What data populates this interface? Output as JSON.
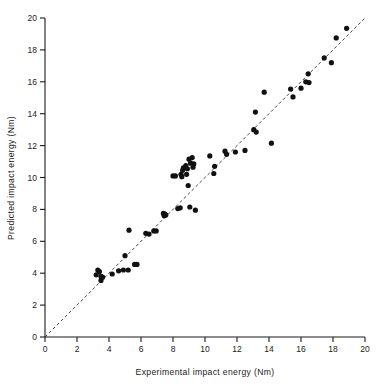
{
  "chart_data": {
    "type": "scatter",
    "title": "",
    "xlabel": "Experimental impact energy  (Nm)",
    "ylabel": "Predicted impact energy  (Nm)",
    "xlim": [
      0,
      20
    ],
    "ylim": [
      0,
      20
    ],
    "xticks": [
      0,
      2,
      4,
      6,
      8,
      10,
      12,
      14,
      16,
      18,
      20
    ],
    "yticks": [
      0,
      2,
      4,
      6,
      8,
      10,
      12,
      14,
      16,
      18,
      20
    ],
    "xtick_labels": [
      "0",
      "2",
      "4",
      "6",
      "8",
      "10",
      "12",
      "14",
      "16",
      "18",
      "20"
    ],
    "ytick_labels": [
      "0",
      "2",
      "4",
      "6",
      "8",
      "10",
      "12",
      "14",
      "16",
      "18",
      "20"
    ],
    "grid": false,
    "legend": null,
    "marker": "filled-circle",
    "marker_color": "#111111",
    "reference_line": {
      "name": "y = x parity line",
      "style": "dashed",
      "color": "#2b2b2b",
      "from": [
        0,
        0
      ],
      "to": [
        20,
        20
      ]
    },
    "points": [
      [
        3.2,
        3.9
      ],
      [
        3.3,
        4.2
      ],
      [
        3.4,
        4.1
      ],
      [
        3.5,
        3.8
      ],
      [
        3.5,
        3.55
      ],
      [
        3.6,
        3.75
      ],
      [
        4.2,
        3.95
      ],
      [
        4.6,
        4.15
      ],
      [
        4.9,
        4.2
      ],
      [
        5.0,
        5.1
      ],
      [
        5.2,
        4.2
      ],
      [
        5.25,
        6.7
      ],
      [
        5.6,
        4.55
      ],
      [
        5.75,
        4.55
      ],
      [
        6.3,
        6.5
      ],
      [
        6.5,
        6.45
      ],
      [
        6.8,
        6.65
      ],
      [
        6.95,
        6.65
      ],
      [
        7.4,
        7.75
      ],
      [
        7.45,
        7.6
      ],
      [
        7.5,
        7.7
      ],
      [
        7.55,
        7.65
      ],
      [
        8.0,
        10.1
      ],
      [
        8.15,
        10.1
      ],
      [
        8.3,
        8.05
      ],
      [
        8.45,
        8.1
      ],
      [
        8.5,
        10.2
      ],
      [
        8.55,
        10.05
      ],
      [
        8.6,
        10.45
      ],
      [
        8.65,
        10.6
      ],
      [
        8.8,
        10.75
      ],
      [
        8.85,
        10.2
      ],
      [
        8.9,
        10.55
      ],
      [
        8.95,
        9.5
      ],
      [
        9.0,
        11.15
      ],
      [
        9.05,
        8.15
      ],
      [
        9.1,
        10.9
      ],
      [
        9.2,
        11.25
      ],
      [
        9.25,
        10.65
      ],
      [
        9.3,
        10.85
      ],
      [
        9.4,
        7.95
      ],
      [
        10.3,
        11.35
      ],
      [
        10.55,
        10.25
      ],
      [
        10.6,
        10.7
      ],
      [
        11.25,
        11.65
      ],
      [
        11.35,
        11.45
      ],
      [
        11.9,
        11.6
      ],
      [
        12.5,
        11.7
      ],
      [
        13.05,
        13.0
      ],
      [
        13.2,
        12.85
      ],
      [
        13.15,
        14.1
      ],
      [
        13.7,
        15.35
      ],
      [
        14.15,
        12.15
      ],
      [
        15.35,
        15.55
      ],
      [
        15.5,
        15.05
      ],
      [
        16.0,
        15.6
      ],
      [
        16.3,
        16.0
      ],
      [
        16.45,
        16.5
      ],
      [
        16.5,
        15.95
      ],
      [
        17.45,
        17.5
      ],
      [
        17.9,
        17.2
      ],
      [
        18.2,
        18.75
      ],
      [
        18.85,
        19.35
      ]
    ]
  },
  "axes": {
    "x_title": "Experimental impact energy  (Nm)",
    "y_title": "Predicted impact energy  (Nm)"
  }
}
